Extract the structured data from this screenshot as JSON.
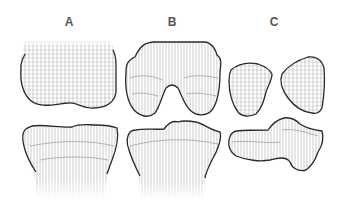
{
  "figure": {
    "panels": [
      {
        "id": "A",
        "label": "A",
        "parts": [
          "femur-condyle-top",
          "tibia-plateau-bottom"
        ]
      },
      {
        "id": "B",
        "label": "B",
        "parts": [
          "notched-condyle-top",
          "tibia-plateau-bottom"
        ]
      },
      {
        "id": "C",
        "label": "C",
        "parts": [
          "separated-condyle-left",
          "separated-condyle-right",
          "irregular-plateau-bottom"
        ]
      }
    ],
    "colors": {
      "outline": "#2a2a2a",
      "hatch": "#9a9a9a",
      "label": "#555555"
    }
  }
}
